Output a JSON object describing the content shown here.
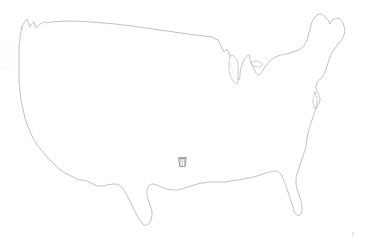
{
  "canvas": {
    "width": 367,
    "height": 243,
    "background_color": "#ffffff",
    "description": "Faint pencil-style outline map of the contiguous United States"
  },
  "map": {
    "title": "Contiguous United States outline",
    "outline_color": "#a9a9ad",
    "fill_color": "#ffffff",
    "lake_outline_color": "#b0b0b4",
    "regions_visible": [
      "Pacific Northwest coast",
      "California coast",
      "Northern border with Canada",
      "Great Lakes",
      "Michigan Lower Peninsula",
      "Northeast and Maine",
      "Atlantic seaboard",
      "Florida peninsula",
      "Gulf of Mexico coast",
      "Texas and Rio Grande"
    ]
  },
  "marker": {
    "label": "map-marker",
    "icon": "basket-icon",
    "color": "#8e8e92",
    "position": {
      "x": 177,
      "y": 156
    },
    "approx_region": "south-central United States"
  },
  "artifacts": {
    "corner_speck": "scan-speck",
    "edge_smudge": "scan-smudge"
  }
}
